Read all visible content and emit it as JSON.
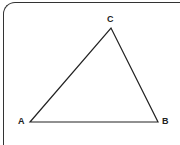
{
  "diagram": {
    "type": "triangle",
    "vertices": [
      {
        "label": "A",
        "x": 30,
        "y": 122
      },
      {
        "label": "B",
        "x": 158,
        "y": 122
      },
      {
        "label": "C",
        "x": 111,
        "y": 28
      }
    ],
    "stroke_color": "#222222"
  }
}
